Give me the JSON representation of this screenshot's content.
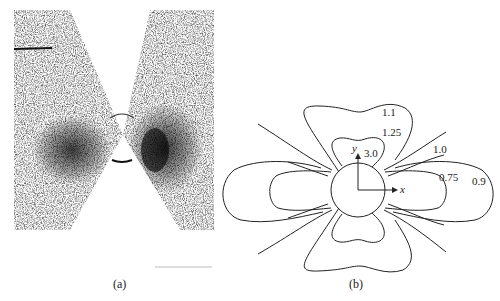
{
  "panel_a": {
    "caption": "(a)",
    "description": "speckle/diffraction pattern with dark lobes on left and right of central circle"
  },
  "panel_b": {
    "caption": "(b)",
    "axis_x": "x",
    "axis_y": "y",
    "contour_labels": [
      "1.1",
      "1.25",
      "3.0",
      "1.0",
      "0.75",
      "0.9"
    ]
  }
}
